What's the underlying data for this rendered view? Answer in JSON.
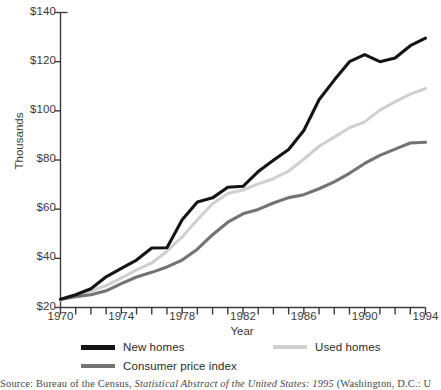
{
  "figure": {
    "source_note_prefix": "Source: Bureau of the Census,",
    "source_note_italic": " Statistical Abstract of the United States: 1995 ",
    "source_note_suffix": "(Washington, D.C.: U",
    "source_note_full": "Source: Bureau of the Census, Statistical Abstract of the United States: 1995 (Washington, D.C.: U"
  },
  "chart_data": {
    "type": "line",
    "title": "",
    "xlabel": "Year",
    "ylabel": "Thousands",
    "xlim": [
      1970,
      1994
    ],
    "ylim": [
      20,
      140
    ],
    "grid": false,
    "legend_position": "bottom",
    "ytick_labels": [
      "$140",
      "$120",
      "$100",
      "$80",
      "$60",
      "$40",
      "$20"
    ],
    "ytick_values": [
      140,
      120,
      100,
      80,
      60,
      40,
      20
    ],
    "xtick_labels": [
      "1970",
      "1974",
      "1978",
      "1982",
      "1986",
      "1990",
      "1994"
    ],
    "xtick_values": [
      1970,
      1974,
      1978,
      1982,
      1986,
      1990,
      1994
    ],
    "x": [
      1970,
      1971,
      1972,
      1973,
      1974,
      1975,
      1976,
      1977,
      1978,
      1979,
      1980,
      1981,
      1982,
      1983,
      1984,
      1985,
      1986,
      1987,
      1988,
      1989,
      1990,
      1991,
      1992,
      1993,
      1994
    ],
    "series": [
      {
        "name": "New homes",
        "color": "#141414",
        "width": 3.1,
        "values": [
          23.4,
          25.2,
          27.6,
          32.5,
          35.9,
          39.3,
          44.2,
          44.3,
          55.7,
          62.9,
          64.6,
          68.9,
          69.3,
          75.3,
          79.9,
          84.3,
          92.0,
          104.5,
          112.5,
          120.0,
          122.9,
          120.0,
          121.5,
          126.5,
          129.6
        ]
      },
      {
        "name": "Used homes",
        "color": "#d0d0d0",
        "width": 3.1,
        "values": [
          23.0,
          24.8,
          26.7,
          28.9,
          32.0,
          35.3,
          38.1,
          42.9,
          48.7,
          55.7,
          62.2,
          66.4,
          67.8,
          70.3,
          72.4,
          75.5,
          80.3,
          85.6,
          89.3,
          93.1,
          95.5,
          100.3,
          103.7,
          106.8,
          109.1
        ]
      },
      {
        "name": "Consumer price index",
        "color": "#737373",
        "width": 3.1,
        "values": [
          23.4,
          24.4,
          25.2,
          26.8,
          29.7,
          32.4,
          34.3,
          36.5,
          39.3,
          43.7,
          49.6,
          54.7,
          58.1,
          59.9,
          62.5,
          64.7,
          65.9,
          68.3,
          71.1,
          74.6,
          78.6,
          81.9,
          84.4,
          86.9,
          87.2
        ]
      }
    ]
  }
}
